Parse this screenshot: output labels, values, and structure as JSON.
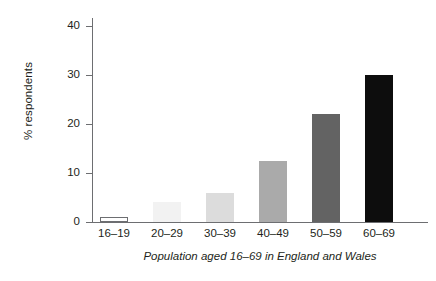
{
  "chart_data": {
    "type": "bar",
    "title": "",
    "xlabel": "Population aged 16–69 in England and Wales",
    "ylabel": "% respondents",
    "categories": [
      "16–19",
      "20–29",
      "30–39",
      "40–49",
      "50–59",
      "60–69"
    ],
    "values": [
      1,
      4,
      6,
      12.5,
      22,
      30
    ],
    "bar_colors": [
      "#ffffff",
      "#f2f2f2",
      "#dcdcdc",
      "#aaaaaa",
      "#636363",
      "#0d0d0d"
    ],
    "bar_borders": [
      "#6d6e71",
      "none",
      "none",
      "none",
      "none",
      "none"
    ],
    "ylim": [
      0,
      44
    ],
    "yticks": [
      0,
      10,
      20,
      30,
      40
    ],
    "ytick_labels": [
      "0",
      "10",
      "20",
      "30",
      "40"
    ],
    "grid": false,
    "legend": null,
    "axis_color": "#6d6e71",
    "text_color": "#231f20"
  }
}
